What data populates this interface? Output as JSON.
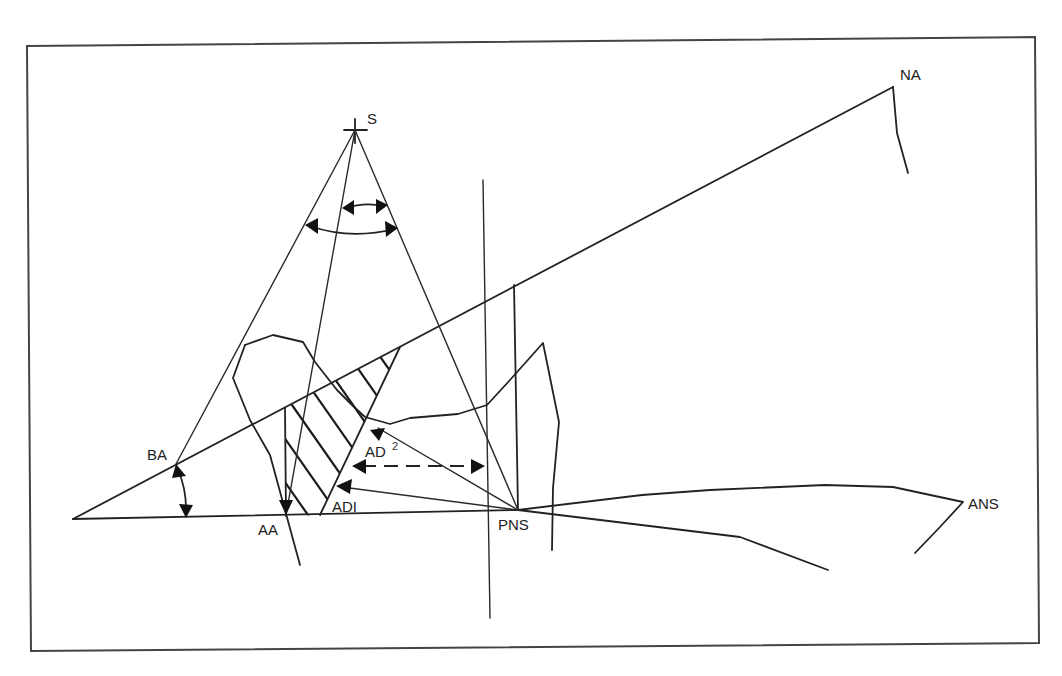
{
  "diagram": {
    "type": "cephalometric tracing",
    "colors": {
      "line": "#222222",
      "background": "#ffffff",
      "frame": "#444444"
    },
    "labels": {
      "S": "S",
      "NA": "NA",
      "BA": "BA",
      "AA": "AA",
      "ADI": "ADI",
      "AD2": "AD",
      "AD2_sup": "2",
      "PNS": "PNS",
      "ANS": "ANS"
    },
    "landmarks": [
      {
        "id": "S",
        "x": 355,
        "y": 130
      },
      {
        "id": "NA",
        "x": 893,
        "y": 87
      },
      {
        "id": "BA",
        "x": 176,
        "y": 464
      },
      {
        "id": "AA",
        "x": 286,
        "y": 515
      },
      {
        "id": "PNS",
        "x": 518,
        "y": 510
      },
      {
        "id": "ANS",
        "x": 963,
        "y": 502
      },
      {
        "id": "ADI",
        "x": 335,
        "y": 490
      },
      {
        "id": "AD2",
        "x": 372,
        "y": 433
      }
    ]
  }
}
